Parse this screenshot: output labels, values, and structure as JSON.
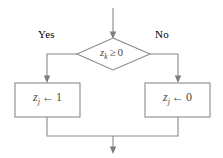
{
  "diagram": {
    "type": "flowchart",
    "background_color": "#ffffff",
    "line_color": "#8a8a8a",
    "text_color": "#4a4a4a",
    "nodes": [
      {
        "id": "decision",
        "shape": "diamond",
        "variable": "z",
        "subscript": "k",
        "operator": "≥",
        "value": "0",
        "text": "z_k ≥ 0"
      },
      {
        "id": "yes_branch_box",
        "shape": "rectangle",
        "variable": "z",
        "subscript": "j",
        "operator": "←",
        "value": "1",
        "text": "z_j ← 1"
      },
      {
        "id": "no_branch_box",
        "shape": "rectangle",
        "variable": "z",
        "subscript": "j",
        "operator": "←",
        "value": "0",
        "text": "z_j ← 0"
      }
    ],
    "edge_labels": {
      "yes": "Yes",
      "no": "No"
    },
    "entry_arrow": "arrow-down-icon",
    "exit_arrow": "arrow-down-icon"
  }
}
